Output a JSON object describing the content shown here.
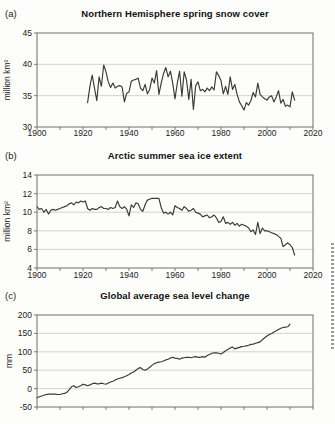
{
  "figure": {
    "background_color": "#fdfdfc",
    "line_color": "#383838",
    "gridline_color": "#c8c8c8",
    "axis_color": "#6e6e6e"
  },
  "chart_data": [
    {
      "type": "line",
      "panel_label": "(a)",
      "title": "Northern Hemisphere spring snow cover",
      "ylabel": "million km²",
      "xlabel": "",
      "x_range": [
        1900,
        2020
      ],
      "y_range": [
        30,
        45
      ],
      "y_ticks": [
        30,
        35,
        40,
        45
      ],
      "x_tick_labels": [
        "1900",
        "1920",
        "1940",
        "1960",
        "1980",
        "2000",
        "2020"
      ],
      "x_tick_minor_step": 10,
      "x_labels_visible": true,
      "grid": true,
      "x_start": 1922,
      "x_step": 1,
      "values": [
        33.9,
        36.5,
        38.3,
        36.2,
        34.2,
        38.0,
        36.5,
        39.9,
        38.8,
        37.2,
        36.3,
        37.0,
        36.2,
        36.5,
        36.6,
        36.4,
        34.0,
        35.4,
        35.6,
        37.3,
        37.5,
        37.6,
        37.8,
        36.2,
        35.8,
        36.8,
        35.3,
        36.0,
        37.8,
        37.0,
        39.0,
        35.2,
        37.0,
        38.5,
        39.5,
        38.0,
        38.9,
        37.0,
        34.5,
        37.0,
        38.9,
        34.9,
        38.8,
        37.5,
        34.4,
        37.6,
        32.8,
        36.6,
        37.2,
        35.8,
        36.0,
        35.6,
        36.2,
        35.8,
        36.4,
        35.9,
        38.8,
        38.2,
        37.4,
        35.3,
        36.5,
        35.2,
        38.0,
        36.0,
        36.8,
        35.2,
        34.0,
        33.4,
        32.7,
        33.9,
        33.5,
        34.2,
        35.5,
        34.8,
        37.0,
        35.2,
        34.8,
        34.5,
        34.3,
        34.8,
        35.0,
        34.0,
        34.8,
        35.8,
        33.8,
        34.4,
        33.3,
        33.5,
        33.2,
        35.6,
        34.3
      ]
    },
    {
      "type": "line",
      "panel_label": "(b)",
      "title": "Arctic summer sea ice extent",
      "ylabel": "million km²",
      "xlabel": "",
      "x_range": [
        1900,
        2020
      ],
      "y_range": [
        4,
        14
      ],
      "y_ticks": [
        4,
        6,
        8,
        10,
        12,
        14
      ],
      "x_tick_labels": [
        "1900",
        "1920",
        "1940",
        "1960",
        "1980",
        "2000",
        "2020"
      ],
      "x_tick_minor_step": 10,
      "x_labels_visible": true,
      "grid": true,
      "x_start": 1900,
      "x_step": 1,
      "values": [
        10.6,
        10.3,
        10.4,
        10.0,
        10.3,
        9.8,
        10.2,
        10.3,
        10.2,
        10.3,
        10.4,
        10.5,
        10.6,
        10.7,
        10.9,
        11.0,
        10.8,
        11.1,
        11.0,
        11.2,
        11.1,
        11.2,
        10.4,
        10.2,
        10.4,
        10.3,
        10.3,
        10.5,
        10.6,
        10.4,
        10.4,
        10.3,
        10.5,
        10.4,
        10.5,
        11.2,
        10.6,
        10.4,
        10.6,
        10.3,
        9.6,
        10.8,
        10.5,
        11.0,
        10.9,
        10.3,
        10.1,
        10.8,
        11.3,
        11.4,
        11.5,
        11.5,
        11.5,
        11.5,
        10.5,
        9.9,
        10.0,
        9.8,
        10.0,
        9.7,
        10.7,
        10.5,
        10.4,
        10.2,
        10.6,
        10.4,
        10.1,
        10.2,
        10.4,
        10.0,
        9.9,
        9.8,
        9.5,
        9.6,
        9.7,
        9.4,
        9.5,
        9.7,
        9.4,
        8.9,
        9.0,
        9.5,
        8.8,
        8.9,
        8.7,
        8.9,
        8.6,
        8.8,
        8.5,
        8.7,
        8.6,
        8.5,
        8.3,
        7.9,
        8.1,
        7.6,
        8.9,
        7.7,
        8.3,
        8.0,
        8.0,
        7.9,
        7.8,
        7.7,
        7.6,
        7.4,
        7.2,
        6.3,
        6.5,
        6.7,
        6.5,
        6.2,
        5.4
      ]
    },
    {
      "type": "line",
      "panel_label": "(c)",
      "title": "Global average sea level change",
      "ylabel": "mm",
      "xlabel": "",
      "x_range": [
        1900,
        2020
      ],
      "y_range": [
        -50,
        200
      ],
      "y_ticks": [
        -50,
        0,
        50,
        100,
        150,
        200
      ],
      "x_tick_labels": [],
      "x_tick_minor_step": 10,
      "x_labels_visible": false,
      "grid": true,
      "x_start": 1900,
      "x_step": 1,
      "values": [
        -25,
        -22,
        -20,
        -18,
        -16,
        -15,
        -15,
        -15,
        -15,
        -16,
        -16,
        -14,
        -13,
        -10,
        -3,
        5,
        8,
        3,
        5,
        8,
        12,
        10,
        8,
        10,
        13,
        15,
        13,
        13,
        15,
        13,
        12,
        15,
        18,
        20,
        23,
        26,
        28,
        30,
        32,
        35,
        38,
        42,
        45,
        50,
        55,
        57,
        52,
        50,
        53,
        58,
        63,
        68,
        70,
        72,
        73,
        75,
        78,
        80,
        83,
        85,
        83,
        82,
        80,
        83,
        84,
        85,
        85,
        84,
        86,
        87,
        85,
        85,
        87,
        85,
        90,
        93,
        96,
        97,
        97,
        96,
        94,
        98,
        103,
        106,
        110,
        113,
        108,
        110,
        112,
        114,
        115,
        116,
        118,
        120,
        121,
        123,
        125,
        127,
        133,
        138,
        143,
        147,
        150,
        154,
        157,
        161,
        164,
        166,
        167,
        168,
        175
      ]
    }
  ]
}
